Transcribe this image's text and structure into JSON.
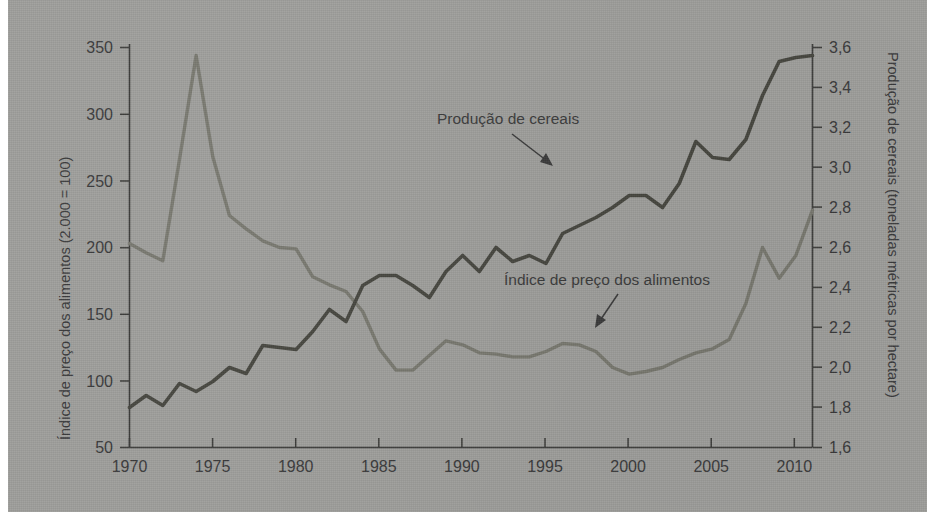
{
  "chart_data": {
    "type": "line",
    "title": "",
    "xlabel": "",
    "ylabel": "Índice de preço dos alimentos (2.000 = 100)",
    "y2label": "Produção de cereais (toneladas métricas por hectare)",
    "grid": false,
    "legend_position": "inline-annotations",
    "xlim": [
      1970,
      2011
    ],
    "xticks": [
      "1970",
      "1975",
      "1980",
      "1985",
      "1990",
      "1995",
      "2000",
      "2005",
      "2010"
    ],
    "xtick_values": [
      1970,
      1975,
      1980,
      1985,
      1990,
      1995,
      2000,
      2005,
      2010
    ],
    "ylim": [
      50,
      350
    ],
    "yticks": [
      "50",
      "100",
      "150",
      "200",
      "250",
      "300",
      "350"
    ],
    "ytick_values": [
      50,
      100,
      150,
      200,
      250,
      300,
      350
    ],
    "y2lim": [
      1.6,
      3.6
    ],
    "y2ticks": [
      "1,6",
      "1,8",
      "2,0",
      "2,2",
      "2,4",
      "2,6",
      "2,8",
      "3,0",
      "3,2",
      "3,4",
      "3,6"
    ],
    "y2tick_values": [
      1.6,
      1.8,
      2.0,
      2.2,
      2.4,
      2.6,
      2.8,
      3.0,
      3.2,
      3.4,
      3.6
    ],
    "annotations": [
      {
        "text": "Produção de cereais",
        "series": "cereal_production",
        "x": 1988.5,
        "y": 3.16
      },
      {
        "text": "Índice de preço dos alimentos",
        "series": "food_price_index",
        "x": 1994.5,
        "y": 167
      }
    ],
    "series": [
      {
        "name": "Índice de preço dos alimentos",
        "axis": "left",
        "unit": "index (2.000 = 100)",
        "color": "#78786f",
        "x": [
          1970,
          1971,
          1972,
          1973,
          1974,
          1975,
          1976,
          1977,
          1978,
          1979,
          1980,
          1981,
          1982,
          1983,
          1984,
          1985,
          1986,
          1987,
          1988,
          1989,
          1990,
          1991,
          1992,
          1993,
          1994,
          1995,
          1996,
          1997,
          1998,
          1999,
          2000,
          2001,
          2002,
          2003,
          2004,
          2005,
          2006,
          2007,
          2008,
          2009,
          2010,
          2011
        ],
        "values": [
          203,
          196,
          190,
          266,
          344,
          268,
          224,
          214,
          205,
          200,
          199,
          178,
          172,
          167,
          152,
          124,
          108,
          108,
          119,
          130,
          127,
          121,
          120,
          118,
          118,
          122,
          128,
          127,
          122,
          110,
          105,
          107,
          110,
          116,
          121,
          124,
          131,
          158,
          200,
          177,
          194,
          228
        ]
      },
      {
        "name": "Produção de cereais",
        "axis": "right",
        "unit": "toneladas métricas por hectare",
        "color": "#46463f",
        "x": [
          1970,
          1971,
          1972,
          1973,
          1974,
          1975,
          1976,
          1977,
          1978,
          1979,
          1980,
          1981,
          1982,
          1983,
          1984,
          1985,
          1986,
          1987,
          1988,
          1989,
          1990,
          1991,
          1992,
          1993,
          1994,
          1995,
          1996,
          1997,
          1998,
          1999,
          2000,
          2001,
          2002,
          2003,
          2004,
          2005,
          2006,
          2007,
          2008,
          2009,
          2010,
          2011
        ],
        "values": [
          1.8,
          1.86,
          1.81,
          1.92,
          1.88,
          1.93,
          2.0,
          1.97,
          2.11,
          2.1,
          2.09,
          2.18,
          2.29,
          2.23,
          2.41,
          2.46,
          2.46,
          2.41,
          2.35,
          2.48,
          2.56,
          2.48,
          2.6,
          2.53,
          2.56,
          2.52,
          2.67,
          2.71,
          2.75,
          2.8,
          2.86,
          2.86,
          2.8,
          2.92,
          3.13,
          3.05,
          3.04,
          3.14,
          3.36,
          3.53,
          3.55,
          3.56
        ]
      }
    ]
  },
  "axes": {
    "left_title": "Índice de preço dos alimentos (2.000 = 100)",
    "right_title": "Produção de cereais (toneladas métricas por hectare)"
  },
  "labels": {
    "cereal": "Produção de cereais",
    "price": "Índice de preço dos alimentos"
  }
}
